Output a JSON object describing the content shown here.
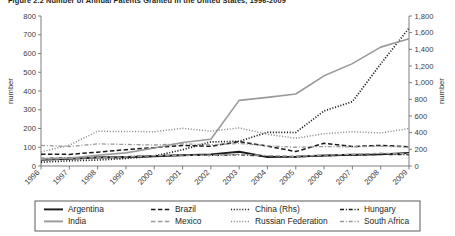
{
  "figure": {
    "title": "Figure 2.2  Number of Annual Patents Granted in the United States, 1996-2009",
    "title_truncated": true
  },
  "chart_data": {
    "type": "line",
    "title": "Figure 2.2  Number of Annual Patents Granted in the United States, 1996-2009",
    "xlabel": "",
    "ylabel": "number",
    "ylabel_right": "number",
    "x": [
      1996,
      1997,
      1998,
      1999,
      2000,
      2001,
      2002,
      2003,
      2004,
      2005,
      2006,
      2007,
      2008,
      2009
    ],
    "xtick_labels": [
      "1996",
      "1997",
      "1998",
      "1999",
      "2000",
      "2001",
      "2002",
      "2003",
      "2004",
      "2005",
      "2006",
      "2007",
      "2008",
      "2009"
    ],
    "ylim": [
      0,
      800
    ],
    "ytick_labels": [
      "0",
      "100",
      "200",
      "300",
      "400",
      "500",
      "600",
      "700",
      "800"
    ],
    "ytick_values": [
      0,
      100,
      200,
      300,
      400,
      500,
      600,
      700,
      800
    ],
    "ylim_right": [
      0,
      1800
    ],
    "ytick_labels_right": [
      "0",
      "200",
      "400",
      "600",
      "800",
      "1,000",
      "1,200",
      "1,400",
      "1,600",
      "1,800"
    ],
    "ytick_values_right": [
      0,
      200,
      400,
      600,
      800,
      1000,
      1200,
      1400,
      1600,
      1800
    ],
    "grid": false,
    "legend_position": "below",
    "series": [
      {
        "name": "Argentina",
        "axis": "left",
        "style": "solid",
        "color": "#1a1a1a",
        "width": 1.9,
        "values": [
          33,
          38,
          45,
          47,
          52,
          57,
          62,
          76,
          48,
          50,
          56,
          60,
          62,
          70
        ]
      },
      {
        "name": "Brazil",
        "axis": "left",
        "style": "dashed",
        "color": "#1a1a1a",
        "width": 1.5,
        "values": [
          63,
          62,
          74,
          87,
          98,
          110,
          105,
          130,
          106,
          77,
          121,
          104,
          110,
          103
        ]
      },
      {
        "name": "China (Rhs)",
        "axis": "right",
        "style": "dotted",
        "color": "#1a1a1a",
        "width": 1.7,
        "values": [
          46,
          62,
          72,
          90,
          119,
          195,
          289,
          297,
          404,
          402,
          661,
          772,
          1225,
          1655
        ]
      },
      {
        "name": "Hungary",
        "axis": "left",
        "style": "dashdot",
        "color": "#1a1a1a",
        "width": 1.3,
        "values": [
          40,
          44,
          47,
          50,
          55,
          58,
          56,
          60,
          52,
          48,
          55,
          58,
          62,
          60
        ]
      },
      {
        "name": "India",
        "axis": "left",
        "style": "solid",
        "color": "#9a9a9a",
        "width": 1.6,
        "values": [
          38,
          43,
          57,
          70,
          96,
          125,
          143,
          350,
          366,
          384,
          481,
          546,
          634,
          679
        ]
      },
      {
        "name": "Mexico",
        "axis": "left",
        "style": "dashed",
        "color": "#9a9a9a",
        "width": 1.4,
        "values": [
          37,
          40,
          45,
          48,
          55,
          58,
          57,
          63,
          55,
          52,
          58,
          62,
          68,
          65
        ]
      },
      {
        "name": "Russian Federation",
        "axis": "left",
        "style": "dotted",
        "color": "#8f8f8f",
        "width": 1.5,
        "values": [
          75,
          111,
          185,
          184,
          183,
          201,
          186,
          203,
          169,
          148,
          172,
          183,
          176,
          200
        ]
      },
      {
        "name": "South Africa",
        "axis": "left",
        "style": "dashdot",
        "color": "#9a9a9a",
        "width": 1.3,
        "values": [
          110,
          104,
          118,
          115,
          112,
          118,
          113,
          120,
          108,
          100,
          104,
          102,
          106,
          100
        ]
      }
    ]
  },
  "legend": {
    "entries": [
      {
        "label": "Argentina",
        "style": "solid",
        "color": "#1a1a1a"
      },
      {
        "label": "Brazil",
        "style": "dashed",
        "color": "#1a1a1a"
      },
      {
        "label": "China (Rhs)",
        "style": "dotted",
        "color": "#1a1a1a"
      },
      {
        "label": "Hungary",
        "style": "dashdot",
        "color": "#1a1a1a"
      },
      {
        "label": "India",
        "style": "solid",
        "color": "#9a9a9a"
      },
      {
        "label": "Mexico",
        "style": "dashed",
        "color": "#9a9a9a"
      },
      {
        "label": "Russian Federation",
        "style": "dotted",
        "color": "#8f8f8f"
      },
      {
        "label": "South Africa",
        "style": "dashdot",
        "color": "#9a9a9a"
      }
    ]
  }
}
